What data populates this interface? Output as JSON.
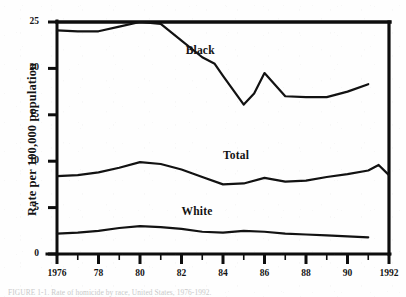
{
  "figure": {
    "ylabel": "Rate per 100,000 population",
    "caption": "FIGURE 1-1. Rate of homicide by race, United States, 1976-1992."
  },
  "axes": {
    "y_ticks": [
      "0",
      "5",
      "10",
      "15",
      "20",
      "25"
    ],
    "y_values": [
      0,
      5,
      10,
      15,
      20,
      25
    ],
    "x_ticks": [
      "1976",
      "78",
      "80",
      "82",
      "84",
      "86",
      "88",
      "90",
      "1992"
    ],
    "x_tick_years": [
      1976,
      1978,
      1980,
      1982,
      1984,
      1986,
      1988,
      1990,
      1992
    ]
  },
  "series_labels": {
    "black": "Black",
    "total": "Total",
    "white": "White"
  },
  "chart_data": {
    "type": "line",
    "title": "",
    "xlabel": "",
    "ylabel": "Rate per 100,000 population",
    "xlim": [
      1976,
      1992
    ],
    "ylim": [
      0,
      25
    ],
    "grid": false,
    "legend": "inline-labels",
    "x": [
      1976,
      1977,
      1978,
      1979,
      1980,
      1981,
      1982,
      1983,
      1984,
      1985,
      1986,
      1987,
      1988,
      1989,
      1990,
      1991,
      1992
    ],
    "series": [
      {
        "name": "Black",
        "values": [
          24.1,
          24.0,
          24.0,
          24.5,
          25.0,
          24.8,
          23.0,
          21.2,
          20.5,
          19.2,
          16.1,
          17.3,
          19.5,
          17.0,
          16.9,
          16.9,
          17.5,
          18.3
        ],
        "x_values": [
          1976,
          1977,
          1978,
          1979,
          1980,
          1981,
          1982,
          1983,
          1983.6,
          1984,
          1985,
          1985.5,
          1986,
          1987,
          1988,
          1989,
          1990,
          1991
        ],
        "label_at": {
          "x": 1982.2,
          "y": 21.8
        }
      },
      {
        "name": "Total",
        "values": [
          8.4,
          8.5,
          8.8,
          9.3,
          9.9,
          9.7,
          9.1,
          8.3,
          7.5,
          7.6,
          8.2,
          7.8,
          7.9,
          8.3,
          8.6,
          9.0,
          9.6,
          8.5
        ],
        "x_values": [
          1976,
          1977,
          1978,
          1979,
          1980,
          1981,
          1982,
          1983,
          1984,
          1985,
          1986,
          1987,
          1988,
          1989,
          1990,
          1991,
          1991.5,
          1992
        ],
        "label_at": {
          "x": 1984.0,
          "y": 10.4
        }
      },
      {
        "name": "White",
        "values": [
          2.2,
          2.3,
          2.5,
          2.8,
          3.0,
          2.9,
          2.7,
          2.4,
          2.3,
          2.5,
          2.4,
          2.2,
          2.1,
          2.0,
          1.9,
          1.8
        ],
        "x_values": [
          1976,
          1977,
          1978,
          1979,
          1980,
          1981,
          1982,
          1983,
          1984,
          1985,
          1986,
          1987,
          1988,
          1989,
          1990,
          1991
        ],
        "label_at": {
          "x": 1982.0,
          "y": 4.4
        }
      }
    ]
  },
  "style": {
    "line_color": "#121212",
    "frame_color": "#0d0d0d",
    "background": "#fefefe"
  }
}
